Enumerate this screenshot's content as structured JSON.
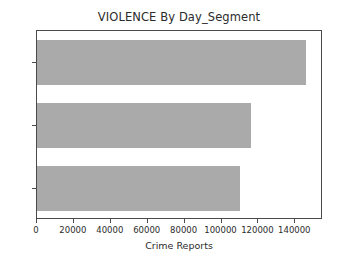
{
  "chart_data": {
    "type": "bar",
    "orientation": "horizontal",
    "title": "VIOLENCE By Day_Segment",
    "xlabel": "Crime Reports",
    "ylabel": "",
    "categories": [
      "AM",
      "AFT",
      "NIT"
    ],
    "values": [
      110000,
      116000,
      146000
    ],
    "series": [
      {
        "name": "Crime Reports",
        "values": [
          110000,
          116000,
          146000
        ]
      }
    ],
    "xlim": [
      0,
      155000
    ],
    "xticks": [
      0,
      20000,
      40000,
      60000,
      80000,
      100000,
      120000,
      140000
    ],
    "xtick_labels": [
      "0",
      "20000",
      "40000",
      "60000",
      "80000",
      "100000",
      "120000",
      "140000"
    ],
    "ytick_labels": [
      "AM",
      "AFT",
      "NIT"
    ],
    "grid": false,
    "legend": false,
    "bar_color": "#aaaaaa",
    "axis_color": "#4a4a4a",
    "background": "#ffffff",
    "text_color": "#2b2b2b"
  }
}
